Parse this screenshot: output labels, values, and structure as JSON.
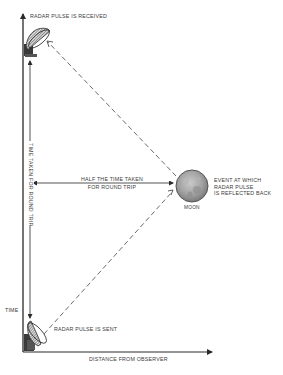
{
  "diagram": {
    "axes": {
      "vertical_label": "TIME",
      "horizontal_label": "DISTANCE FROM OBSERVER"
    },
    "labels": {
      "received": "RADAR PULSE IS RECEIVED",
      "sent": "RADAR PULSE IS SENT",
      "round_trip": "TIME TAKEN FOR ROUND TRIP",
      "half_time_line1": "HALF THE TIME TAKEN",
      "half_time_line2": "FOR ROUND TRIP",
      "event_line1": "EVENT AT WHICH",
      "event_line2": "RADAR PULSE",
      "event_line3": "IS REFLECTED BACK",
      "moon": "MOON"
    },
    "icons": {
      "top_dish": "radar-dish-icon",
      "bottom_dish": "radar-dish-icon",
      "moon": "moon-icon"
    },
    "colors": {
      "line": "#2a2a2a",
      "dish": "#3a3a3a",
      "moon_fill": "#9a9a9a",
      "moon_edge": "#555555",
      "background": "#ffffff"
    }
  }
}
